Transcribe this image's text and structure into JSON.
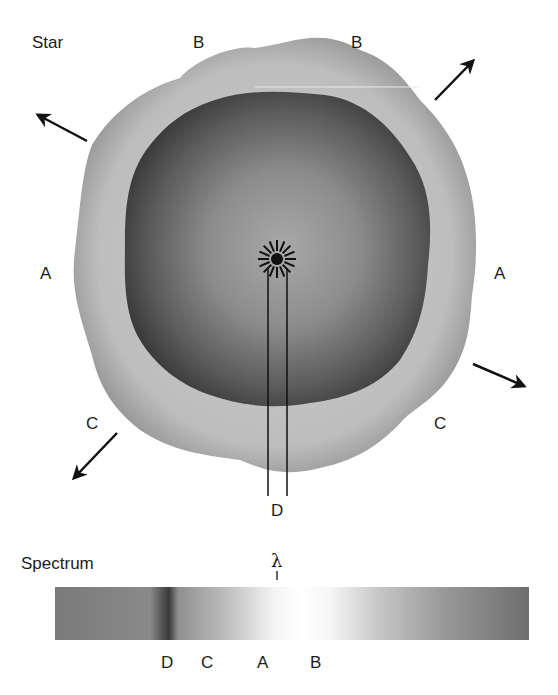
{
  "star_panel": {
    "title": "Star",
    "region_labels": {
      "top_left": "B",
      "top_right": "B",
      "left": "A",
      "right": "A",
      "bottom_left": "C",
      "bottom_right": "C",
      "bottom_center": "D"
    },
    "arrows": [
      "arrow-up-left",
      "arrow-up-right",
      "arrow-down-left",
      "arrow-down-right"
    ],
    "center_icon": "sun-burst-icon"
  },
  "spectrum_panel": {
    "title": "Spectrum",
    "wavelength_symbol": "λ",
    "position_labels": [
      "D",
      "C",
      "A",
      "B"
    ]
  },
  "colors": {
    "outer_shell": "#bdbdbd",
    "inner_body": "#4a4a4a",
    "ink": "#111111"
  }
}
